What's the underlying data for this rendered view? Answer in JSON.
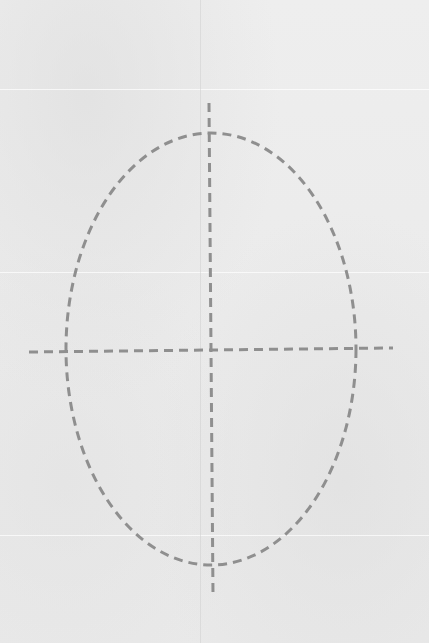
{
  "paper": {
    "background_color": "#ececec",
    "stroke_color": "#8f8f8f"
  },
  "drawing": {
    "ellipse": {
      "cx": 211,
      "cy": 349,
      "rx": 145,
      "ry": 216,
      "style": "dashed"
    },
    "horizontal_axis": {
      "x1": 29,
      "y1": 352,
      "x2": 393,
      "y2": 348,
      "style": "dashed"
    },
    "vertical_axis": {
      "x1": 209,
      "y1": 103,
      "x2": 213,
      "y2": 595,
      "style": "dashed"
    }
  }
}
